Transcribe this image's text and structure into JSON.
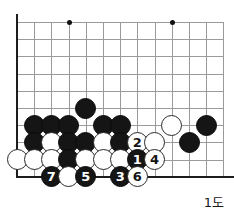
{
  "diagram": {
    "type": "go-board",
    "caption": "1도",
    "board": {
      "origin_x": 17,
      "origin_y": 22,
      "cell": 17.2,
      "cols": 13,
      "rows": 10,
      "left_edge": true,
      "bottom_edge": true,
      "line_color": "#9a9a9a",
      "edge_color": "#1d1d1d",
      "background": "#ffffff"
    },
    "star_points": [
      {
        "col": 3,
        "row": 0
      },
      {
        "col": 9,
        "row": 0
      }
    ],
    "stones": [
      {
        "col": 4,
        "row": 5,
        "color": "black",
        "label": ""
      },
      {
        "col": 1,
        "row": 6,
        "color": "black",
        "label": ""
      },
      {
        "col": 2,
        "row": 6,
        "color": "black",
        "label": ""
      },
      {
        "col": 3,
        "row": 6,
        "color": "black",
        "label": ""
      },
      {
        "col": 5,
        "row": 6,
        "color": "black",
        "label": ""
      },
      {
        "col": 6,
        "row": 6,
        "color": "black",
        "label": ""
      },
      {
        "col": 9,
        "row": 6,
        "color": "white",
        "label": ""
      },
      {
        "col": 11,
        "row": 6,
        "color": "black",
        "label": ""
      },
      {
        "col": 1,
        "row": 7,
        "color": "black",
        "label": ""
      },
      {
        "col": 2,
        "row": 7,
        "color": "white",
        "label": ""
      },
      {
        "col": 3,
        "row": 7,
        "color": "black",
        "label": ""
      },
      {
        "col": 4,
        "row": 7,
        "color": "black",
        "label": ""
      },
      {
        "col": 5,
        "row": 7,
        "color": "white",
        "label": ""
      },
      {
        "col": 6,
        "row": 7,
        "color": "black",
        "label": ""
      },
      {
        "col": 7,
        "row": 7,
        "color": "white",
        "label": "2"
      },
      {
        "col": 8,
        "row": 7,
        "color": "white",
        "label": ""
      },
      {
        "col": 10,
        "row": 7,
        "color": "black",
        "label": ""
      },
      {
        "col": 0,
        "row": 8,
        "color": "white",
        "label": ""
      },
      {
        "col": 1,
        "row": 8,
        "color": "white",
        "label": ""
      },
      {
        "col": 2,
        "row": 8,
        "color": "white",
        "label": ""
      },
      {
        "col": 3,
        "row": 8,
        "color": "black",
        "label": ""
      },
      {
        "col": 4,
        "row": 8,
        "color": "white",
        "label": ""
      },
      {
        "col": 5,
        "row": 8,
        "color": "white",
        "label": ""
      },
      {
        "col": 6,
        "row": 8,
        "color": "white",
        "label": ""
      },
      {
        "col": 7,
        "row": 8,
        "color": "black",
        "label": "1"
      },
      {
        "col": 8,
        "row": 8,
        "color": "white",
        "label": "4"
      },
      {
        "col": 2,
        "row": 9,
        "color": "black",
        "label": "7"
      },
      {
        "col": 3,
        "row": 9,
        "color": "white",
        "label": ""
      },
      {
        "col": 4,
        "row": 9,
        "color": "black",
        "label": "5"
      },
      {
        "col": 6,
        "row": 9,
        "color": "black",
        "label": "3"
      },
      {
        "col": 7,
        "row": 9,
        "color": "white",
        "label": "6"
      }
    ]
  }
}
